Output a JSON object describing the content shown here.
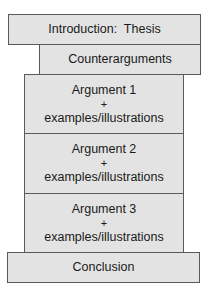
{
  "diagram": {
    "fill_color": "#e3e3e3",
    "border_color": "#5a5a5a",
    "blocks": [
      {
        "label": "Introduction:  Thesis"
      },
      {
        "label": "Counterarguments"
      },
      {
        "label": "Argument 1",
        "plus": "+",
        "detail": "examples/illustrations"
      },
      {
        "label": "Argument 2",
        "plus": "+",
        "detail": "examples/illustrations"
      },
      {
        "label": "Argument 3",
        "plus": "+",
        "detail": "examples/illustrations"
      },
      {
        "label": "Conclusion"
      }
    ]
  }
}
